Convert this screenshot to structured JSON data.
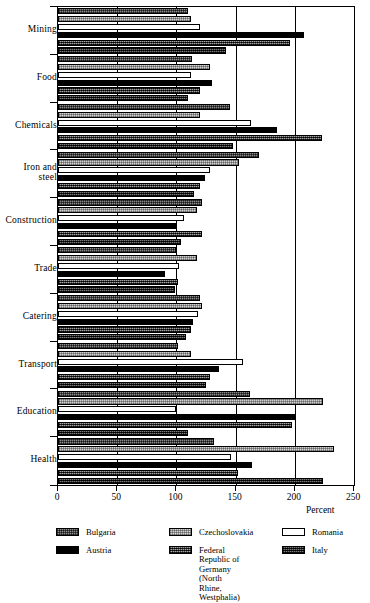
{
  "chart_data": {
    "type": "bar",
    "orientation": "horizontal",
    "title": "",
    "xlabel": "Percent",
    "ylabel": "",
    "xlim": [
      0,
      250
    ],
    "xticks": [
      0,
      50,
      100,
      150,
      200,
      250
    ],
    "grid": true,
    "grid_axis": "x",
    "legend_position": "bottom",
    "categories": [
      "Mining",
      "Food",
      "Chemicals",
      "Iron and\nsteel",
      "Construction",
      "Trade",
      "Catering",
      "Transport",
      "Education",
      "Health"
    ],
    "series": [
      {
        "name": "Bulgaria",
        "color": "#8d8d8d",
        "pattern": "checker-medium",
        "values": [
          110,
          113,
          145,
          170,
          122,
          100,
          120,
          101,
          162,
          132
        ]
      },
      {
        "name": "Czechoslovakia",
        "color": "#d2d2d2",
        "pattern": "checker-light",
        "values": [
          112,
          128,
          120,
          153,
          117,
          117,
          122,
          112,
          224,
          233
        ]
      },
      {
        "name": "Romania",
        "color": "#ffffff",
        "pattern": "solid-white",
        "values": [
          120,
          112,
          163,
          128,
          106,
          102,
          118,
          156,
          100,
          146
        ]
      },
      {
        "name": "Austria",
        "color": "#000000",
        "pattern": "solid-black",
        "values": [
          208,
          130,
          185,
          124,
          100,
          90,
          114,
          136,
          200,
          164
        ]
      },
      {
        "name": "Federal Republic of Germany (North Rhine, Westphalia)",
        "color": "#5c5c5c",
        "pattern": "checker-dark",
        "values": [
          196,
          120,
          223,
          120,
          122,
          101,
          112,
          128,
          198,
          152
        ]
      },
      {
        "name": "Italy",
        "color": "#3a3a3a",
        "pattern": "checker-darkest",
        "values": [
          142,
          110,
          148,
          115,
          104,
          99,
          108,
          125,
          110,
          224
        ]
      }
    ]
  },
  "legend": {
    "items": [
      {
        "label": "Bulgaria",
        "series": "Bulgaria"
      },
      {
        "label": "Czechoslovakia",
        "series": "Czechoslovakia"
      },
      {
        "label": "Romania",
        "series": "Romania"
      },
      {
        "label": "Austria",
        "series": "Austria"
      },
      {
        "label": "Federal Republic of\nGermany (North Rhine,\nWestphalia)",
        "series": "Federal Republic of Germany"
      },
      {
        "label": "Italy",
        "series": "Italy"
      }
    ]
  }
}
